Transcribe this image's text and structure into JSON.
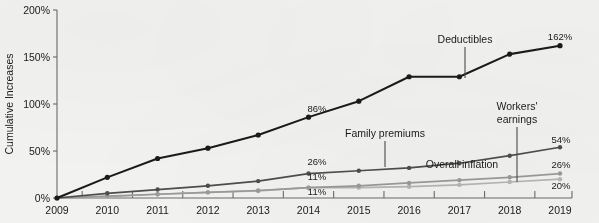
{
  "chart_data": {
    "type": "line",
    "title": "",
    "subtitle": "",
    "xlabel": "",
    "ylabel": "Cumulative Increases",
    "x": [
      2009,
      2010,
      2011,
      2012,
      2013,
      2014,
      2015,
      2016,
      2017,
      2018,
      2019
    ],
    "categories": [
      "2009",
      "2010",
      "2011",
      "2012",
      "2013",
      "2014",
      "2015",
      "2016",
      "2017",
      "2018",
      "2019"
    ],
    "xtick_labels": [
      "2009",
      "2010",
      "2011",
      "2012",
      "2013",
      "2014",
      "2015",
      "2016",
      "2017",
      "2018",
      "2019"
    ],
    "ytick_labels": [
      "0%",
      "50%",
      "100%",
      "150%",
      "200%"
    ],
    "ytick_values": [
      0,
      50,
      100,
      150,
      200
    ],
    "ylim": [
      0,
      200
    ],
    "xlim": [
      2009,
      2019
    ],
    "grid": false,
    "legend": "none (inline series labels)",
    "series": [
      {
        "name": "Deductibles",
        "color": "#1a1a1a",
        "values": [
          0,
          22,
          42,
          53,
          67,
          86,
          103,
          129,
          129,
          153,
          162
        ],
        "end_label": "162%",
        "mid_label": "86%",
        "mid_label_year": "2014"
      },
      {
        "name": "Family premiums",
        "color": "#4d4d4d",
        "values": [
          0,
          5,
          9,
          13,
          18,
          26,
          29,
          32,
          37,
          45,
          54
        ],
        "end_label": "54%",
        "mid_label": "26%",
        "mid_label_year": "2014"
      },
      {
        "name": "Workers' earnings",
        "color": "#9a9a9a",
        "values": [
          0,
          2,
          4,
          6,
          8,
          11,
          13,
          16,
          19,
          22,
          26
        ],
        "end_label": "26%",
        "mid_label": "11%",
        "mid_label_year": "2014"
      },
      {
        "name": "Overall inflation",
        "color": "#b5b5b5",
        "values": [
          0,
          1.5,
          4,
          6,
          7.5,
          11,
          11,
          12,
          14,
          17,
          20
        ],
        "end_label": "20%",
        "mid_label": "11%",
        "mid_label_year": "2014"
      }
    ],
    "annotations": [
      {
        "text": "Deductibles",
        "kind": "series-callout",
        "leader": true
      },
      {
        "text": "Family premiums",
        "kind": "series-callout",
        "leader": true
      },
      {
        "text": "Workers'",
        "kind": "series-callout-line1",
        "leader": true
      },
      {
        "text": "earnings",
        "kind": "series-callout-line2",
        "leader": true
      },
      {
        "text": "Overall inflation",
        "kind": "series-callout",
        "leader": false
      }
    ],
    "data_labels": [
      "86%",
      "26%",
      "11%",
      "11%",
      "162%",
      "54%",
      "26%",
      "20%"
    ]
  },
  "axis": {
    "y_title": "Cumulative Increases",
    "y_ticks": [
      "200%",
      "150%",
      "100%",
      "50%",
      "0%"
    ],
    "x_ticks": [
      "2009",
      "2010",
      "2011",
      "2012",
      "2013",
      "2014",
      "2015",
      "2016",
      "2017",
      "2018",
      "2019"
    ]
  },
  "labels": {
    "deductibles": "Deductibles",
    "family_premiums": "Family premiums",
    "workers_earnings_line1": "Workers'",
    "workers_earnings_line2": "earnings",
    "overall_inflation": "Overall inflation",
    "val_deduct_2014": "86%",
    "val_deduct_2019": "162%",
    "val_family_2014": "26%",
    "val_family_2019": "54%",
    "val_workers_2014": "11%",
    "val_workers_2019": "26%",
    "val_inflation_2014": "11%",
    "val_inflation_2019": "20%"
  },
  "colors": {
    "background": "#f2f2f0",
    "deductibles": "#1a1a1a",
    "family_premiums": "#4d4d4d",
    "workers_earnings": "#9a9a9a",
    "overall_inflation": "#b5b5b5",
    "axis": "#6b6b6b",
    "text": "#1a1a1a"
  }
}
